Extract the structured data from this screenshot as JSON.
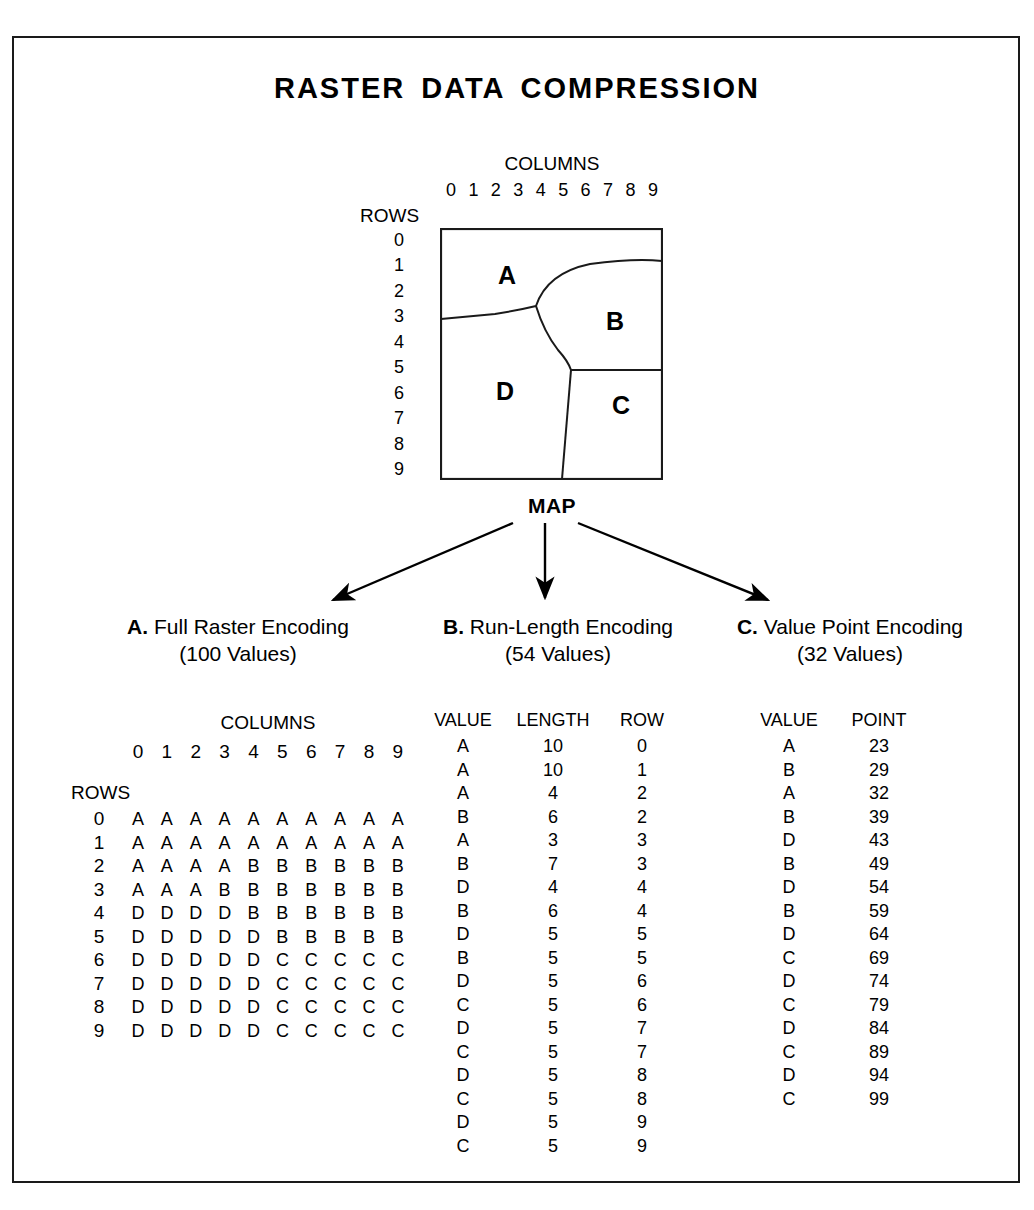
{
  "title": "RASTER DATA COMPRESSION",
  "map": {
    "columns_label": "COLUMNS",
    "rows_label": "ROWS",
    "column_numbers": [
      "0",
      "1",
      "2",
      "3",
      "4",
      "5",
      "6",
      "7",
      "8",
      "9"
    ],
    "row_numbers": [
      "0",
      "1",
      "2",
      "3",
      "4",
      "5",
      "6",
      "7",
      "8",
      "9"
    ],
    "caption": "MAP",
    "region_labels": [
      "A",
      "B",
      "C",
      "D"
    ]
  },
  "sections": [
    {
      "letter": "A.",
      "name": "Full Raster Encoding",
      "count": "(100 Values)"
    },
    {
      "letter": "B.",
      "name": "Run-Length Encoding",
      "count": "(54 Values)"
    },
    {
      "letter": "C.",
      "name": "Value Point Encoding",
      "count": "(32 Values)"
    }
  ],
  "full_raster": {
    "columns_label": "COLUMNS",
    "rows_label": "ROWS",
    "column_numbers": [
      "0",
      "1",
      "2",
      "3",
      "4",
      "5",
      "6",
      "7",
      "8",
      "9"
    ],
    "row_numbers": [
      "0",
      "1",
      "2",
      "3",
      "4",
      "5",
      "6",
      "7",
      "8",
      "9"
    ],
    "rows": [
      [
        "A",
        "A",
        "A",
        "A",
        "A",
        "A",
        "A",
        "A",
        "A",
        "A"
      ],
      [
        "A",
        "A",
        "A",
        "A",
        "A",
        "A",
        "A",
        "A",
        "A",
        "A"
      ],
      [
        "A",
        "A",
        "A",
        "A",
        "B",
        "B",
        "B",
        "B",
        "B",
        "B"
      ],
      [
        "A",
        "A",
        "A",
        "B",
        "B",
        "B",
        "B",
        "B",
        "B",
        "B"
      ],
      [
        "D",
        "D",
        "D",
        "D",
        "B",
        "B",
        "B",
        "B",
        "B",
        "B"
      ],
      [
        "D",
        "D",
        "D",
        "D",
        "D",
        "B",
        "B",
        "B",
        "B",
        "B"
      ],
      [
        "D",
        "D",
        "D",
        "D",
        "D",
        "C",
        "C",
        "C",
        "C",
        "C"
      ],
      [
        "D",
        "D",
        "D",
        "D",
        "D",
        "C",
        "C",
        "C",
        "C",
        "C"
      ],
      [
        "D",
        "D",
        "D",
        "D",
        "D",
        "C",
        "C",
        "C",
        "C",
        "C"
      ],
      [
        "D",
        "D",
        "D",
        "D",
        "D",
        "C",
        "C",
        "C",
        "C",
        "C"
      ]
    ]
  },
  "run_length": {
    "headers": [
      "VALUE",
      "LENGTH",
      "ROW"
    ],
    "rows": [
      [
        "A",
        "10",
        "0"
      ],
      [
        "A",
        "10",
        "1"
      ],
      [
        "A",
        "4",
        "2"
      ],
      [
        "B",
        "6",
        "2"
      ],
      [
        "A",
        "3",
        "3"
      ],
      [
        "B",
        "7",
        "3"
      ],
      [
        "D",
        "4",
        "4"
      ],
      [
        "B",
        "6",
        "4"
      ],
      [
        "D",
        "5",
        "5"
      ],
      [
        "B",
        "5",
        "5"
      ],
      [
        "D",
        "5",
        "6"
      ],
      [
        "C",
        "5",
        "6"
      ],
      [
        "D",
        "5",
        "7"
      ],
      [
        "C",
        "5",
        "7"
      ],
      [
        "D",
        "5",
        "8"
      ],
      [
        "C",
        "5",
        "8"
      ],
      [
        "D",
        "5",
        "9"
      ],
      [
        "C",
        "5",
        "9"
      ]
    ]
  },
  "value_point": {
    "headers": [
      "VALUE",
      "POINT"
    ],
    "rows": [
      [
        "A",
        "23"
      ],
      [
        "B",
        "29"
      ],
      [
        "A",
        "32"
      ],
      [
        "B",
        "39"
      ],
      [
        "D",
        "43"
      ],
      [
        "B",
        "49"
      ],
      [
        "D",
        "54"
      ],
      [
        "B",
        "59"
      ],
      [
        "D",
        "64"
      ],
      [
        "C",
        "69"
      ],
      [
        "D",
        "74"
      ],
      [
        "C",
        "79"
      ],
      [
        "D",
        "84"
      ],
      [
        "C",
        "89"
      ],
      [
        "D",
        "94"
      ],
      [
        "C",
        "99"
      ]
    ]
  },
  "colors": {
    "ink": "#000000",
    "frame": "#1a1a1a",
    "background": "#ffffff"
  }
}
